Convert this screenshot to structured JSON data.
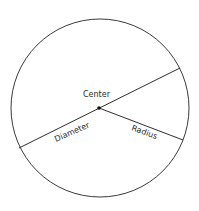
{
  "diagram": {
    "type": "circle-parts",
    "circle": {
      "cx": 100,
      "cy": 108,
      "r": 89,
      "stroke": "#3a3a3a"
    },
    "center_point": {
      "x": 99,
      "y": 108
    },
    "diameter": {
      "x1": 19,
      "y1": 148,
      "x2": 180,
      "y2": 68
    },
    "radius": {
      "x1": 99,
      "y1": 108,
      "x2": 183,
      "y2": 140
    },
    "labels": {
      "center": "Center",
      "diameter": "Diameter",
      "radius": "Radius"
    }
  }
}
